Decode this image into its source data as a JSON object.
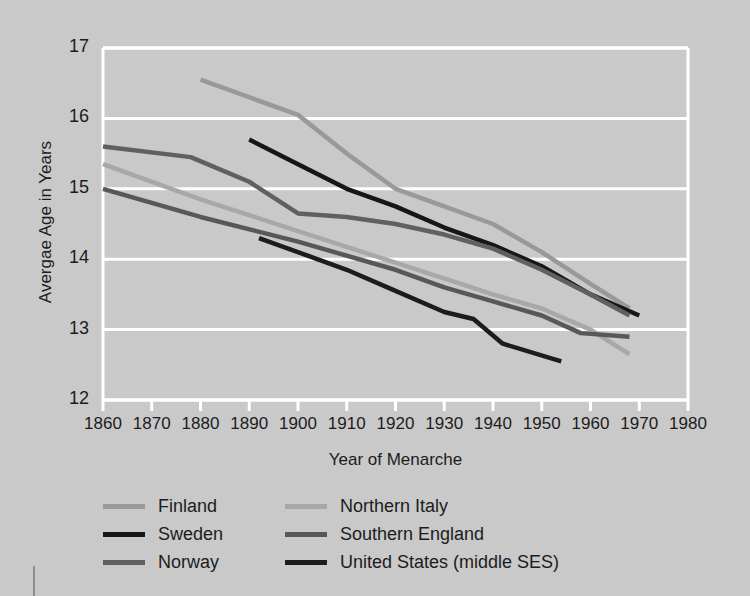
{
  "chart_data": {
    "type": "line",
    "title": "",
    "xlabel": "Year of Menarche",
    "ylabel": "Avergae Age in Years",
    "xlim": [
      1860,
      1980
    ],
    "ylim": [
      12,
      17
    ],
    "xticks": [
      "1860",
      "1870",
      "1880",
      "1890",
      "1900",
      "1910",
      "1920",
      "1930",
      "1940",
      "1950",
      "1960",
      "1970",
      "1980"
    ],
    "yticks": [
      "12",
      "13",
      "14",
      "15",
      "16",
      "17"
    ],
    "grid": "horizontal",
    "legend_position": "below-axes",
    "background_color": "#c9c9c9",
    "grid_color": "#ffffff",
    "series": [
      {
        "name": "Finland",
        "color": "#999999",
        "x": [
          1880,
          1900,
          1910,
          1920,
          1930,
          1940,
          1950,
          1960,
          1968
        ],
        "y": [
          16.55,
          16.05,
          15.5,
          15.0,
          14.75,
          14.5,
          14.1,
          13.65,
          13.3
        ]
      },
      {
        "name": "Sweden",
        "color": "#161616",
        "x": [
          1890,
          1900,
          1910,
          1920,
          1930,
          1940,
          1950,
          1960,
          1970
        ],
        "y": [
          15.7,
          15.35,
          15.0,
          14.75,
          14.45,
          14.2,
          13.9,
          13.5,
          13.2
        ]
      },
      {
        "name": "Norway",
        "color": "#606060",
        "x": [
          1860,
          1878,
          1890,
          1900,
          1910,
          1920,
          1930,
          1940,
          1950,
          1960,
          1968
        ],
        "y": [
          15.6,
          15.45,
          15.1,
          14.65,
          14.6,
          14.5,
          14.35,
          14.15,
          13.85,
          13.5,
          13.2
        ]
      },
      {
        "name": "Northern Italy",
        "color": "#a8a8a8",
        "x": [
          1860,
          1880,
          1900,
          1920,
          1940,
          1950,
          1960,
          1968
        ],
        "y": [
          15.35,
          14.85,
          14.4,
          13.95,
          13.5,
          13.3,
          13.0,
          12.65
        ]
      },
      {
        "name": "Southern England",
        "color": "#585858",
        "x": [
          1860,
          1880,
          1900,
          1920,
          1930,
          1940,
          1950,
          1958,
          1968
        ],
        "y": [
          15.0,
          14.6,
          14.25,
          13.85,
          13.6,
          13.4,
          13.2,
          12.95,
          12.9
        ]
      },
      {
        "name": "United States (middle SES)",
        "color": "#1c1c1c",
        "x": [
          1892,
          1910,
          1920,
          1930,
          1936,
          1942,
          1954
        ],
        "y": [
          14.3,
          13.85,
          13.55,
          13.25,
          13.15,
          12.8,
          12.55
        ]
      }
    ]
  },
  "legend": {
    "column1": [
      "Finland",
      "Sweden",
      "Norway"
    ],
    "column2": [
      "Northern Italy",
      "Southern England",
      "United States (middle SES)"
    ]
  }
}
